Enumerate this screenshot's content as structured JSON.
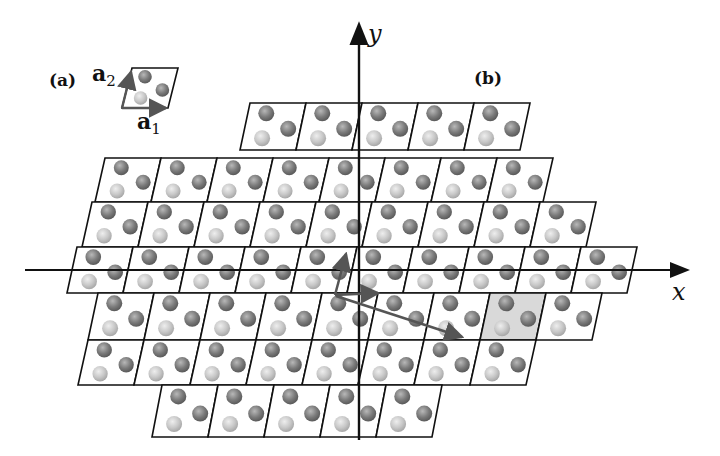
{
  "figure": {
    "panel_a_label": "(a)",
    "panel_b_label": "(b)",
    "vector_a1": {
      "base": "a",
      "sub": "1"
    },
    "vector_a2": {
      "base": "a",
      "sub": "2"
    },
    "axis_x_label": "x",
    "axis_y_label": "y"
  },
  "colors": {
    "line": "#111111",
    "arrow": "#555555",
    "highlight_cell": "#d9d9d9",
    "atom_dark": "#7a7a7a",
    "atom_light": "#c4c4c4"
  },
  "lattice": {
    "cell_width": 56,
    "shear": 10,
    "rows": [
      {
        "y_top": 103,
        "y_bot": 150,
        "x_start": 240,
        "count": 5
      },
      {
        "y_top": 158,
        "y_bot": 202,
        "x_start": 95,
        "count": 8
      },
      {
        "y_top": 202,
        "y_bot": 247,
        "x_start": 82,
        "count": 9
      },
      {
        "y_top": 247,
        "y_bot": 293,
        "x_start": 67,
        "count": 10
      },
      {
        "y_top": 293,
        "y_bot": 340,
        "x_start": 88,
        "count": 9
      },
      {
        "y_top": 340,
        "y_bot": 385,
        "x_start": 78,
        "count": 8
      },
      {
        "y_top": 385,
        "y_bot": 437,
        "x_start": 152,
        "count": 5
      }
    ],
    "highlight": {
      "row": 4,
      "col": 7
    }
  },
  "unit_cell_inset": {
    "x": 122,
    "y": 68,
    "w": 46,
    "h": 40,
    "shear": 10
  }
}
